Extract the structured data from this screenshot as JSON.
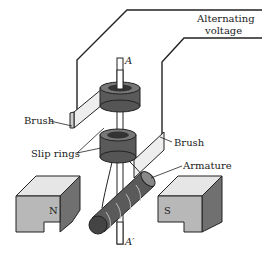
{
  "diagram": {
    "labels": {
      "voltage_line1": "Alternating",
      "voltage_line2": "voltage",
      "axis_top": "A",
      "axis_bottom": "A′",
      "brush_left": "Brush",
      "brush_right": "Brush",
      "slip_rings": "Slip rings",
      "armature": "Armature",
      "north_pole": "N",
      "south_pole": "S"
    },
    "colors": {
      "line": "#222222",
      "ring": "#5a5a5a",
      "magnet_face": "#b8b8b8",
      "magnet_top": "#e6e6e6",
      "magnet_side": "#707070"
    }
  }
}
